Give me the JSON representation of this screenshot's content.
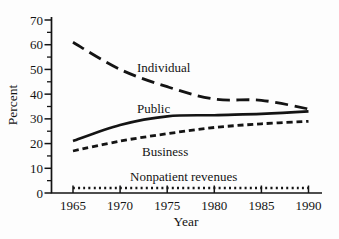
{
  "figure": {
    "background": "#fdfdfd",
    "ink": "#141414"
  },
  "chart_data": {
    "type": "line",
    "title": "",
    "xlabel": "Year",
    "ylabel": "Percent",
    "x": [
      1965,
      1970,
      1975,
      1980,
      1985,
      1990
    ],
    "xtick_labels": [
      "1965",
      "1970",
      "1975",
      "1980",
      "1985",
      "1990"
    ],
    "xlim": [
      1965,
      1990
    ],
    "ylim": [
      0,
      70
    ],
    "yticks_major": [
      0,
      10,
      20,
      30,
      40,
      50,
      60,
      70
    ],
    "yticks_minor": [
      5,
      15,
      25,
      35,
      45,
      55,
      65
    ],
    "grid": false,
    "legend": "inline-labels",
    "series": [
      {
        "name": "Individual",
        "line_style": "long-dash",
        "values": [
          61,
          50,
          43,
          38,
          37.5,
          34
        ]
      },
      {
        "name": "Public",
        "line_style": "solid",
        "values": [
          21,
          27.5,
          31,
          31.5,
          32,
          33
        ]
      },
      {
        "name": "Business",
        "line_style": "short-dash",
        "values": [
          17,
          21,
          24,
          26.5,
          28,
          29
        ]
      },
      {
        "name": "Nonpatient revenues",
        "line_style": "dotted",
        "values": [
          2,
          2,
          2,
          2,
          2,
          2
        ]
      }
    ],
    "annotations": [
      {
        "text": "Individual",
        "x_px": 137,
        "y_px": 72
      },
      {
        "text": "Public",
        "x_px": 137,
        "y_px": 113
      },
      {
        "text": "Business",
        "x_px": 142,
        "y_px": 156
      },
      {
        "text": "Nonpatient revenues",
        "x_px": 130,
        "y_px": 181
      }
    ]
  }
}
